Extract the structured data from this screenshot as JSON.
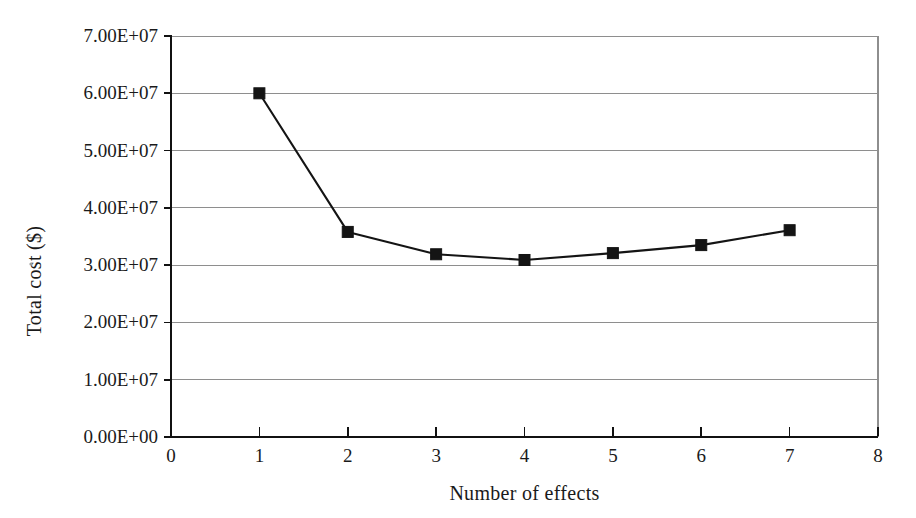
{
  "chart_data": {
    "type": "line",
    "title": "",
    "subtitle": "",
    "xlabel": "Number of effects",
    "ylabel": "Total cost ($)",
    "xlim": [
      0,
      8
    ],
    "ylim": [
      0,
      70000000
    ],
    "grid": "horizontal",
    "legend": "none",
    "marker": "square",
    "x": [
      1,
      2,
      3,
      4,
      5,
      6,
      7
    ],
    "values": [
      60000000,
      35800000,
      31900000,
      30900000,
      32100000,
      33500000,
      36100000
    ],
    "series": [
      {
        "name": "Total cost",
        "x": [
          1,
          2,
          3,
          4,
          5,
          6,
          7
        ],
        "values": [
          60000000,
          35800000,
          31900000,
          30900000,
          32100000,
          33500000,
          36100000
        ]
      }
    ],
    "xticks": [
      0,
      1,
      2,
      3,
      4,
      5,
      6,
      7,
      8
    ],
    "xticklabels": [
      "0",
      "1",
      "2",
      "3",
      "4",
      "5",
      "6",
      "7",
      "8"
    ],
    "yticks": [
      0,
      10000000,
      20000000,
      30000000,
      40000000,
      50000000,
      60000000,
      70000000
    ],
    "yticklabels": [
      "0.00E+00",
      "1.00E+07",
      "2.00E+07",
      "3.00E+07",
      "4.00E+07",
      "5.00E+07",
      "6.00E+07",
      "7.00E+07"
    ],
    "colors": {
      "line": "#141414",
      "marker": "#141414",
      "grid": "#8e8e8e",
      "axis": "#111111",
      "background": "#ffffff"
    }
  }
}
